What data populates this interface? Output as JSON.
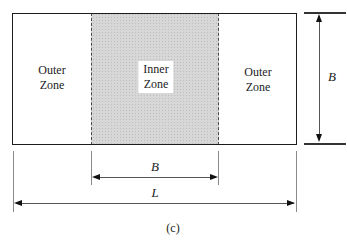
{
  "figure": {
    "caption": "(c)",
    "zones": {
      "outer_left": "Outer\nZone",
      "inner": "Inner\nZone",
      "outer_right": "Outer\nZone"
    },
    "dimensions": {
      "width_label": "B",
      "inner_width_label": "B",
      "length_label": "L"
    },
    "colors": {
      "outline": "#1c1c1c",
      "inner_fill": "#d7d7d7",
      "stipple_dot": "#bdbdbd",
      "dimension_line": "#555555",
      "extension_line": "#8a8a8a",
      "arrowhead": "#111111",
      "background": "#ffffff"
    }
  }
}
